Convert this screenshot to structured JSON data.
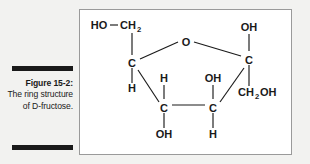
{
  "caption": {
    "figure_number": "Figure 15-2:",
    "description": "The ring structure of D-fructose."
  },
  "figure": {
    "title": "The ring structure of D-fructose",
    "molecule": "D-fructose (fructofuranose ring)",
    "colors": {
      "page_background": "#f2f2f0",
      "figure_background": "#ffffff",
      "figure_border": "#9a9a9a",
      "ink": "#1a1a1a"
    },
    "ring_atoms": [
      {
        "id": "ring-o",
        "label": "O",
        "x": 106,
        "y": 32
      },
      {
        "id": "ring-c2",
        "label": "C",
        "x": 52,
        "y": 53
      },
      {
        "id": "ring-c5",
        "label": "C",
        "x": 169,
        "y": 50
      },
      {
        "id": "ring-c3",
        "label": "C",
        "x": 84,
        "y": 98
      },
      {
        "id": "ring-c4",
        "label": "C",
        "x": 133,
        "y": 98
      }
    ],
    "substituents": [
      {
        "id": "sub-ho",
        "label": "HO",
        "sub": "",
        "x": 19,
        "y": 18
      },
      {
        "id": "sub-ch2",
        "label": "CH",
        "sub": "2",
        "x": 45,
        "y": 18
      },
      {
        "id": "sub-h-c2",
        "label": "H",
        "sub": "",
        "x": 52,
        "y": 81
      },
      {
        "id": "sub-oh-c5",
        "label": "OH",
        "sub": "",
        "x": 169,
        "y": 19
      },
      {
        "id": "sub-ch2oh",
        "label": "CH",
        "sub": "2",
        "tail": "OH",
        "x": 173,
        "y": 84
      },
      {
        "id": "sub-h-c3",
        "label": "H",
        "sub": "",
        "x": 84,
        "y": 70
      },
      {
        "id": "sub-oh-c3",
        "label": "OH",
        "sub": "",
        "x": 84,
        "y": 126
      },
      {
        "id": "sub-oh-c4",
        "label": "OH",
        "sub": "",
        "x": 133,
        "y": 70
      },
      {
        "id": "sub-h-c4",
        "label": "H",
        "sub": "",
        "x": 133,
        "y": 126
      }
    ],
    "bonds": [
      {
        "id": "bond-ho-ch2",
        "type": "horizontal"
      },
      {
        "id": "bond-ch2-c2",
        "type": "vertical"
      },
      {
        "id": "bond-c2-o",
        "type": "ring"
      },
      {
        "id": "bond-o-c5",
        "type": "ring"
      },
      {
        "id": "bond-c5-c4",
        "type": "ring"
      },
      {
        "id": "bond-c4-c3",
        "type": "ring"
      },
      {
        "id": "bond-c3-c2",
        "type": "ring"
      },
      {
        "id": "bond-c2-h",
        "type": "vertical"
      },
      {
        "id": "bond-c5-oh",
        "type": "vertical"
      },
      {
        "id": "bond-c5-ch2oh",
        "type": "vertical"
      },
      {
        "id": "bond-c3-h",
        "type": "vertical"
      },
      {
        "id": "bond-c3-oh",
        "type": "vertical"
      },
      {
        "id": "bond-c4-oh",
        "type": "vertical"
      },
      {
        "id": "bond-c4-h",
        "type": "vertical"
      }
    ]
  }
}
